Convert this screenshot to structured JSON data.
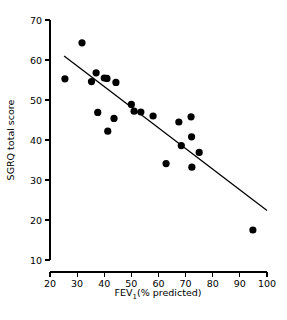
{
  "chart_data": {
    "type": "scatter",
    "title": "",
    "xlabel": "FEV1(% predicted)",
    "xlabel_main": "FEV",
    "xlabel_sub": "1",
    "xlabel_rest": "(% predicted)",
    "ylabel": "SGRQ total score",
    "xlim": [
      20,
      100
    ],
    "ylim": [
      10,
      70
    ],
    "xticks": [
      20,
      30,
      40,
      50,
      60,
      70,
      80,
      90,
      100
    ],
    "yticks": [
      10,
      20,
      30,
      40,
      50,
      60,
      70
    ],
    "grid": false,
    "legend": null,
    "marker": "filled-circle",
    "marker_color": "#000000",
    "points": [
      {
        "x": 25.5,
        "y": 55.3
      },
      {
        "x": 31.8,
        "y": 64.3
      },
      {
        "x": 35.3,
        "y": 54.6
      },
      {
        "x": 37.0,
        "y": 56.8
      },
      {
        "x": 37.6,
        "y": 46.9
      },
      {
        "x": 40.0,
        "y": 55.5
      },
      {
        "x": 41.0,
        "y": 55.4
      },
      {
        "x": 41.3,
        "y": 42.2
      },
      {
        "x": 43.6,
        "y": 45.4
      },
      {
        "x": 44.3,
        "y": 54.4
      },
      {
        "x": 50.0,
        "y": 48.9
      },
      {
        "x": 51.0,
        "y": 47.2
      },
      {
        "x": 53.5,
        "y": 47.0
      },
      {
        "x": 58.0,
        "y": 46.0
      },
      {
        "x": 62.8,
        "y": 34.1
      },
      {
        "x": 67.5,
        "y": 44.5
      },
      {
        "x": 68.4,
        "y": 38.6
      },
      {
        "x": 72.0,
        "y": 45.8
      },
      {
        "x": 72.2,
        "y": 40.8
      },
      {
        "x": 72.3,
        "y": 33.2
      },
      {
        "x": 75.0,
        "y": 36.9
      },
      {
        "x": 94.8,
        "y": 17.5
      }
    ],
    "regression_line": {
      "x_start": 25.2,
      "y_start": 61.0,
      "x_end": 100.0,
      "y_end": 22.4,
      "color": "#000000"
    }
  },
  "axes": {
    "x_tick_labels": [
      "20",
      "30",
      "40",
      "50",
      "60",
      "70",
      "80",
      "90",
      "100"
    ],
    "y_tick_labels": [
      "10",
      "20",
      "30",
      "40",
      "50",
      "60",
      "70"
    ]
  }
}
